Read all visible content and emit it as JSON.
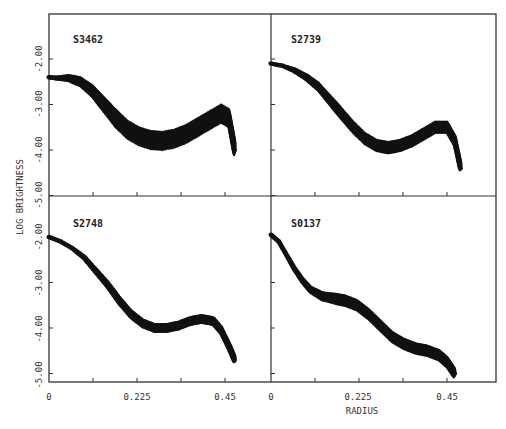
{
  "chart_data": {
    "type": "scatter",
    "layout": "2x2 grid of panels sharing axes",
    "ylabel": "LOG BRIGHTNESS",
    "xlabel": "RADIUS",
    "x_ticks": [
      "0",
      "0.225",
      "0.45"
    ],
    "y_ticks": [
      "-2.00",
      "-3.00",
      "-4.00",
      "-5.00"
    ],
    "xlim": [
      0,
      0.51
    ],
    "ylim": [
      -5.0,
      -1.65
    ],
    "panels": [
      {
        "name": "S3462",
        "band_width": 0.45,
        "x": [
          0.0,
          0.02,
          0.05,
          0.08,
          0.11,
          0.14,
          0.17,
          0.2,
          0.23,
          0.26,
          0.29,
          0.32,
          0.35,
          0.38,
          0.41,
          0.44,
          0.46,
          0.475
        ],
        "y": [
          -2.4,
          -2.42,
          -2.42,
          -2.5,
          -2.7,
          -3.0,
          -3.3,
          -3.55,
          -3.7,
          -3.78,
          -3.8,
          -3.75,
          -3.65,
          -3.5,
          -3.35,
          -3.2,
          -3.3,
          -4.0
        ]
      },
      {
        "name": "S2739",
        "band_width": 0.3,
        "x": [
          0.0,
          0.03,
          0.06,
          0.09,
          0.12,
          0.15,
          0.18,
          0.21,
          0.24,
          0.27,
          0.3,
          0.33,
          0.36,
          0.39,
          0.42,
          0.45,
          0.47,
          0.485
        ],
        "y": [
          -2.1,
          -2.15,
          -2.25,
          -2.4,
          -2.6,
          -2.9,
          -3.2,
          -3.5,
          -3.75,
          -3.9,
          -3.95,
          -3.9,
          -3.8,
          -3.65,
          -3.5,
          -3.5,
          -3.8,
          -4.4
        ]
      },
      {
        "name": "S2748",
        "band_width": 0.22,
        "x": [
          0.0,
          0.03,
          0.06,
          0.09,
          0.12,
          0.15,
          0.18,
          0.21,
          0.24,
          0.27,
          0.3,
          0.33,
          0.36,
          0.39,
          0.42,
          0.44,
          0.46,
          0.475
        ],
        "y": [
          -2.0,
          -2.1,
          -2.25,
          -2.45,
          -2.75,
          -3.05,
          -3.4,
          -3.7,
          -3.9,
          -4.0,
          -4.0,
          -3.95,
          -3.85,
          -3.8,
          -3.85,
          -4.05,
          -4.4,
          -4.7
        ]
      },
      {
        "name": "S0137",
        "band_width": 0.28,
        "x": [
          0.0,
          0.02,
          0.04,
          0.06,
          0.08,
          0.1,
          0.13,
          0.16,
          0.19,
          0.22,
          0.25,
          0.28,
          0.31,
          0.34,
          0.37,
          0.4,
          0.43,
          0.45,
          0.47
        ],
        "y": [
          -1.95,
          -2.1,
          -2.4,
          -2.7,
          -2.95,
          -3.15,
          -3.3,
          -3.35,
          -3.4,
          -3.5,
          -3.7,
          -3.95,
          -4.2,
          -4.35,
          -4.45,
          -4.5,
          -4.6,
          -4.75,
          -5.0
        ]
      }
    ]
  },
  "labels": {
    "ylabel": "LOG BRIGHTNESS",
    "xlabel": "RADIUS",
    "panel_titles": [
      "S3462",
      "S2739",
      "S2748",
      "S0137"
    ]
  }
}
